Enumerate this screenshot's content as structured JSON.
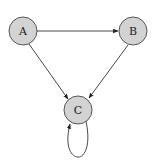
{
  "diagram": {
    "type": "directed-graph",
    "nodes": [
      {
        "id": "A",
        "label": "A",
        "x": 23,
        "y": 31
      },
      {
        "id": "B",
        "label": "B",
        "x": 133,
        "y": 31
      },
      {
        "id": "C",
        "label": "C",
        "x": 78,
        "y": 110
      }
    ],
    "edges": [
      {
        "from": "A",
        "to": "B"
      },
      {
        "from": "A",
        "to": "C"
      },
      {
        "from": "B",
        "to": "C"
      },
      {
        "from": "C",
        "to": "C"
      }
    ],
    "colors": {
      "node_fill": "#d3d3d3",
      "node_stroke": "#555555",
      "edge": "#333333"
    }
  }
}
